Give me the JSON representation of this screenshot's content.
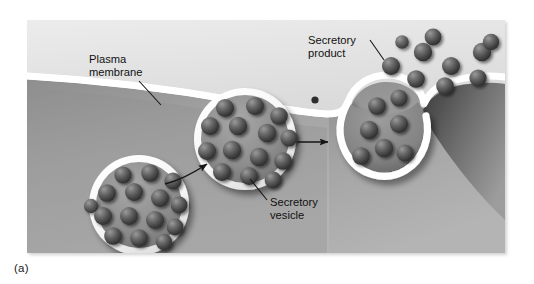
{
  "figure": {
    "caption": "(a)",
    "frame": {
      "x": 27,
      "y": 20,
      "width": 478,
      "height": 233
    }
  },
  "labels": [
    {
      "id": "plasma-membrane",
      "line1": "Plasma",
      "line2": "membrane",
      "text_x": 62,
      "text_y": 43,
      "leader": {
        "x1": 112,
        "y1": 60,
        "x2": 133,
        "y2": 84
      }
    },
    {
      "id": "secretory-product",
      "line1": "Secretory",
      "line2": "product",
      "text_x": 281,
      "text_y": 23,
      "leader": {
        "x1": 341,
        "y1": 29,
        "x2": 370,
        "y2": 44
      }
    },
    {
      "id": "secretory-vesicle",
      "line1": "Secretory",
      "line2": "vesicle",
      "text_x": 243,
      "text_y": 182,
      "leader": {
        "x1": 240,
        "y1": 180,
        "x2": 222,
        "y2": 160
      }
    }
  ],
  "colors": {
    "exterior_top": "#e9e9e9",
    "exterior_bottom": "#bdbdbd",
    "cytoplasm_light": "#a3a3a3",
    "cytoplasm_dark": "#6e6e6e",
    "membrane": "#ffffff",
    "granule_light": "#8a8a8a",
    "granule_dark": "#3a3a3a",
    "label_text": "#111111",
    "arrow": "#161616",
    "vesicle_interior": "#8f8f8f"
  },
  "structures": {
    "vesicle_left": {
      "name": "Secretory vesicle (free in cytoplasm)",
      "cx": 112,
      "cy": 185,
      "r": 50,
      "granule_count": 15
    },
    "vesicle_middle": {
      "name": "Secretory vesicle (approaching membrane)",
      "cx": 218,
      "cy": 119,
      "r": 51,
      "granule_count": 14
    },
    "vesicle_fusing": {
      "name": "Secretory vesicle fused with plasma membrane (omega figure)",
      "cx": 348,
      "cy": 108,
      "granule_count": 7
    },
    "released_product": {
      "name": "Secretory product released to exterior",
      "granule_count": 10
    },
    "lone_granule": {
      "cx": 288,
      "cy": 80,
      "r": 3.6
    }
  },
  "arrows": [
    {
      "id": "arrow-left-to-middle",
      "label": "vesicle migration",
      "x1": 138,
      "y1": 164,
      "x2": 182,
      "y2": 143,
      "curved": true
    },
    {
      "id": "arrow-middle-to-fusing",
      "label": "vesicle fusion",
      "x1": 270,
      "y1": 122,
      "x2": 304,
      "y2": 122,
      "curved": false
    }
  ]
}
